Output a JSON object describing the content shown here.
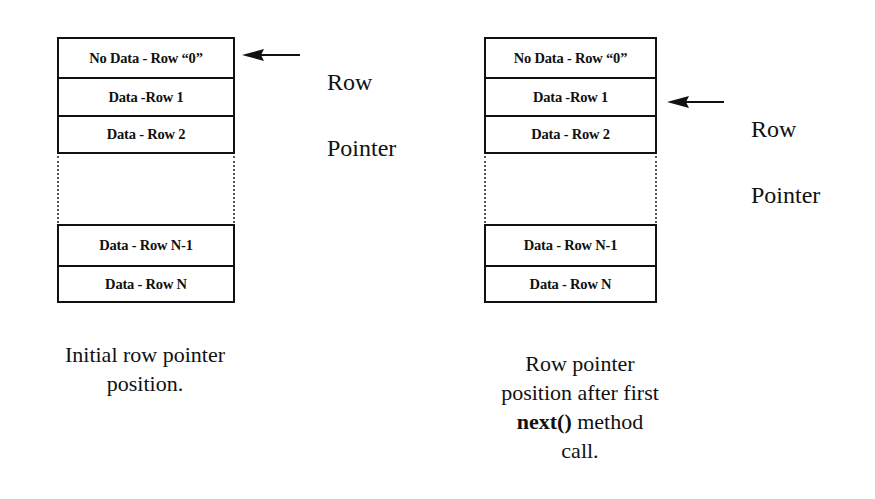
{
  "diagrams": [
    {
      "id": "initial",
      "rows_top": [
        {
          "label": "No Data - Row “0”"
        },
        {
          "label": "Data  -Row 1"
        },
        {
          "label": "Data - Row 2"
        }
      ],
      "rows_bottom": [
        {
          "label": "Data - Row N-1"
        },
        {
          "label": "Data - Row N"
        }
      ],
      "pointer_label_line1": "Row",
      "pointer_label_line2": "Pointer",
      "pointer_target_row": 0,
      "caption_line1": "Initial row pointer",
      "caption_line2": "position."
    },
    {
      "id": "after-next",
      "rows_top": [
        {
          "label": "No Data - Row “0”"
        },
        {
          "label": "Data  -Row 1"
        },
        {
          "label": "Data - Row 2"
        }
      ],
      "rows_bottom": [
        {
          "label": "Data - Row N-1"
        },
        {
          "label": "Data - Row N"
        }
      ],
      "pointer_label_line1": "Row",
      "pointer_label_line2": "Pointer",
      "pointer_target_row": 1,
      "caption_line1": "Row pointer",
      "caption_line2": "position after first",
      "caption_code": "next()",
      "caption_line3_rest": " method",
      "caption_line4": "call."
    }
  ],
  "colors": {
    "line": "#111111",
    "background": "#ffffff",
    "dotted": "#555555"
  }
}
